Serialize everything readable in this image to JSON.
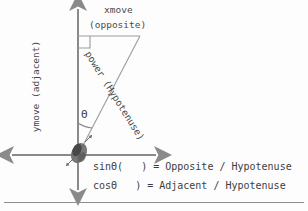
{
  "diagram": {
    "title_present": false,
    "labels": {
      "x_axis_label": "xmove",
      "x_axis_sublabel": "(opposite)",
      "y_axis_label": "ymove (adjacent)",
      "hypotenuse_label": "power (Hypotenuse)",
      "angle_symbol": "Θ"
    },
    "equations": {
      "sine": "sinΘ(   ) = Opposite / Hypotenuse",
      "cosine": "cosΘ   ) = Adjacent / Hypotenuse"
    },
    "icons": {
      "origin_object": "rock-icon",
      "up_arrow": "arrow-up-icon",
      "down_arrow": "arrow-down-icon",
      "left_arrow": "arrow-left-icon",
      "right_arrow": "arrow-right-icon",
      "right_angle_marker": "right-angle-icon",
      "angle_arc": "angle-arc-icon"
    },
    "colors": {
      "axis": "#8a8a8a",
      "triangle": "#9b9b9b",
      "text": "#4a4a4a",
      "object": "#4f4f4f",
      "background": "#fdfdfd",
      "rule": "#8e8e8e"
    },
    "geometry": {
      "origin_x": 78,
      "origin_y": 155,
      "apex_x": 140,
      "apex_y": 36,
      "vertical_top_y": 36,
      "angle_degrees": 27
    }
  }
}
